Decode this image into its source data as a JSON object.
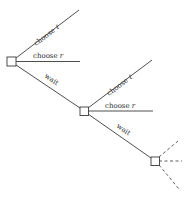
{
  "diagram": {
    "type": "game-tree",
    "nodes": [
      {
        "id": "n1",
        "x": 11.5,
        "y": 61.5,
        "size": 9
      },
      {
        "id": "n2",
        "x": 84,
        "y": 111,
        "size": 8.5
      },
      {
        "id": "n3",
        "x": 155,
        "y": 161,
        "size": 8.5
      }
    ],
    "edges": [
      {
        "from": "n1",
        "label_main": "choose ",
        "label_var": "ℓ",
        "x1": 16,
        "y1": 58,
        "x2": 79,
        "y2": 10,
        "style": "solid"
      },
      {
        "from": "n1",
        "label_main": "choose ",
        "label_var": "r",
        "x1": 16,
        "y1": 61.5,
        "x2": 80,
        "y2": 61.5,
        "style": "solid"
      },
      {
        "from": "n1",
        "label_main": "wait",
        "label_var": "",
        "x1": 16,
        "y1": 65,
        "x2": 80,
        "y2": 108,
        "style": "solid"
      },
      {
        "from": "n2",
        "label_main": "choose ",
        "label_var": "ℓ",
        "x1": 88,
        "y1": 108,
        "x2": 152,
        "y2": 60,
        "style": "solid"
      },
      {
        "from": "n2",
        "label_main": "choose ",
        "label_var": "r",
        "x1": 88,
        "y1": 111,
        "x2": 153,
        "y2": 111,
        "style": "solid"
      },
      {
        "from": "n2",
        "label_main": "wait",
        "label_var": "",
        "x1": 88,
        "y1": 114,
        "x2": 151,
        "y2": 158,
        "style": "solid"
      },
      {
        "from": "n3",
        "label_main": "",
        "label_var": "",
        "x1": 159,
        "y1": 157,
        "x2": 178,
        "y2": 141,
        "style": "dashed"
      },
      {
        "from": "n3",
        "label_main": "",
        "label_var": "",
        "x1": 159,
        "y1": 161,
        "x2": 182,
        "y2": 161,
        "style": "dashed"
      },
      {
        "from": "n3",
        "label_main": "",
        "label_var": "",
        "x1": 159,
        "y1": 165,
        "x2": 179,
        "y2": 189,
        "style": "dashed"
      }
    ],
    "labels": {
      "n1_choose_l": "choose ",
      "n1_choose_l_var": "ℓ",
      "n1_choose_r": "choose ",
      "n1_choose_r_var": "r",
      "n1_wait": "wait",
      "n2_choose_l": "choose ",
      "n2_choose_l_var": "ℓ",
      "n2_choose_r": "choose ",
      "n2_choose_r_var": "r",
      "n2_wait": "wait"
    },
    "colors": {
      "stroke": "#3a3a3a",
      "text": "#2a2a2a",
      "background": "#ffffff"
    }
  }
}
